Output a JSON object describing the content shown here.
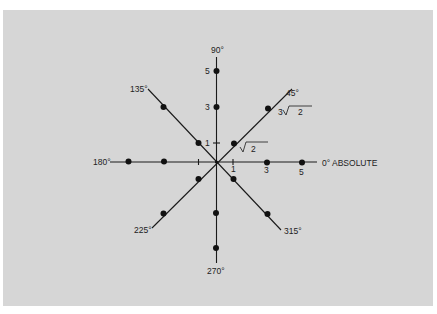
{
  "diagram": {
    "title": "",
    "colors": {
      "panel": "#d6d6d6",
      "ink": "#1a1a1a",
      "page": "#ffffff"
    },
    "direction_labels": {
      "deg0": "0°  ABSOLUTE",
      "deg45": "45°",
      "deg90": "90°",
      "deg135": "135°",
      "deg180": "180°",
      "deg225": "225°",
      "deg270": "270°",
      "deg315": "315°"
    },
    "value_labels": {
      "y5": "5",
      "y3": "3",
      "y1": "1",
      "x1": "1",
      "x3": "3",
      "x5": "5",
      "root2": "2",
      "three_root2_coef": "3",
      "three_root2_rad": "2"
    },
    "points": [
      {
        "axis": "90°",
        "value": 5
      },
      {
        "axis": "90°",
        "value": 3
      },
      {
        "axis": "0°",
        "value": 3
      },
      {
        "axis": "0°",
        "value": 5
      },
      {
        "axis": "180°",
        "value": 3
      },
      {
        "axis": "180°",
        "value": 5
      },
      {
        "axis": "270°",
        "value": 3
      },
      {
        "axis": "270°",
        "value": 5
      },
      {
        "axis": "45°",
        "value": "√2"
      },
      {
        "axis": "45°",
        "value": "3√2"
      },
      {
        "axis": "135°",
        "value": "√2"
      },
      {
        "axis": "135°",
        "value": "3√2"
      },
      {
        "axis": "225°",
        "value": "√2"
      },
      {
        "axis": "225°",
        "value": "3√2"
      },
      {
        "axis": "315°",
        "value": "√2"
      },
      {
        "axis": "315°",
        "value": "3√2"
      }
    ]
  }
}
